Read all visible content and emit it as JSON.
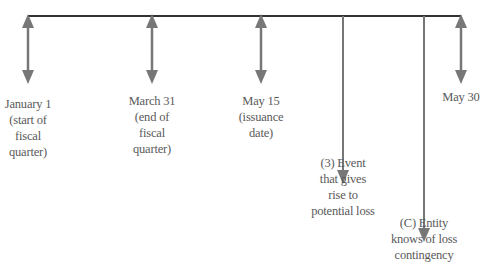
{
  "diagram": {
    "type": "timeline",
    "colors": {
      "main_line": "#333333",
      "arrow": "#777777",
      "text": "#5a5a5a"
    },
    "markers": [
      {
        "id": "jan1",
        "x": 28,
        "y_end": 82,
        "style": "double",
        "lines": [
          "January 1",
          "(start of",
          "fiscal",
          "quarter)"
        ],
        "label_top": 96
      },
      {
        "id": "mar31",
        "x": 152,
        "y_end": 82,
        "style": "double",
        "lines": [
          "March 31",
          "(end of",
          "fiscal",
          "quarter)"
        ],
        "label_top": 93
      },
      {
        "id": "may15",
        "x": 261,
        "y_end": 82,
        "style": "double",
        "lines": [
          "May 15",
          "(issuance",
          "date)"
        ],
        "label_top": 93
      },
      {
        "id": "event",
        "x": 343,
        "y_end": 182,
        "style": "down",
        "lines": [
          "(3) Event",
          "that gives",
          "rise to",
          "potential loss"
        ],
        "label_top": 155
      },
      {
        "id": "entity",
        "x": 424,
        "y_end": 240,
        "style": "down",
        "lines": [
          "(C) Entity",
          "knows of loss",
          "contingency"
        ],
        "label_top": 215
      },
      {
        "id": "may30",
        "x": 461,
        "y_end": 82,
        "style": "double",
        "lines": [
          "May 30"
        ],
        "label_top": 89
      }
    ]
  }
}
